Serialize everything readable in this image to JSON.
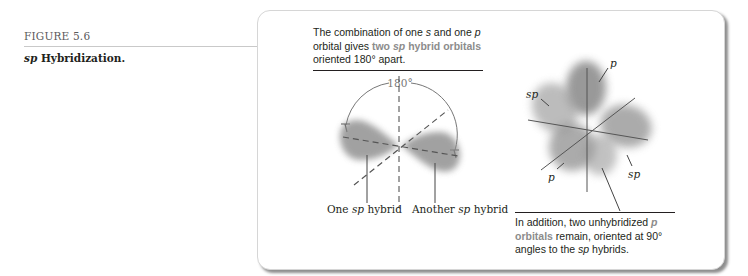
{
  "figure": {
    "label": "FIGURE 5.6",
    "caption_italic": "sp",
    "caption_rest": " Hybridization."
  },
  "top_note": {
    "part1": "The combination of one ",
    "s": "s",
    "part2": " and one ",
    "p": "p",
    "part3": " orbital gives ",
    "hl1": "two ",
    "hl_sp": "sp",
    "hl2": " hybrid orbitals",
    "part4": " oriented 180° apart."
  },
  "left_diagram": {
    "angle_label": "180°",
    "label_one_prefix": "One ",
    "label_one_sp": "sp",
    "label_one_suffix": " hybrid",
    "label_another_prefix": "Another ",
    "label_another_sp": "sp",
    "label_another_suffix": " hybrid"
  },
  "right_diagram": {
    "label_p_top": "p",
    "label_sp_left": "sp",
    "label_p_bottom": "p",
    "label_sp_right": "sp"
  },
  "bottom_note": {
    "part1": "In addition, two unhybridized ",
    "hl_p": "p",
    "hl_orbitals": " orbitals",
    "part2": " remain, oriented at 90° angles to the ",
    "sp": "sp",
    "part3": " hybrids."
  },
  "colors": {
    "highlight_text": "#8c8c8c",
    "orbital_fill": "#8a8a8a",
    "card_border": "#d6d6d6"
  }
}
